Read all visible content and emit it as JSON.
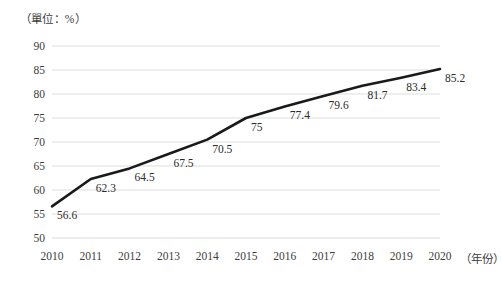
{
  "chart_data": {
    "type": "line",
    "title": "（單位：%）",
    "xlabel": "（年份）",
    "ylabel": "",
    "categories": [
      "2010",
      "2011",
      "2012",
      "2013",
      "2014",
      "2015",
      "2016",
      "2017",
      "2018",
      "2019",
      "2020"
    ],
    "values": [
      56.6,
      62.3,
      64.5,
      67.5,
      70.5,
      75,
      77.4,
      79.6,
      81.7,
      83.4,
      85.2
    ],
    "point_labels": [
      "56.6",
      "62.3",
      "64.5",
      "67.5",
      "70.5",
      "75",
      "77.4",
      "79.6",
      "81.7",
      "83.4",
      "85.2"
    ],
    "ylim": [
      50,
      90
    ],
    "yticks": [
      50,
      55,
      60,
      65,
      70,
      75,
      80,
      85,
      90
    ],
    "ytick_labels": [
      "50",
      "55",
      "60",
      "65",
      "70",
      "75",
      "80",
      "85",
      "90"
    ],
    "grid": "horizontal",
    "legend": "none",
    "series_color": "#1a1a1a",
    "grid_color": "#d9d9d9",
    "line_width": 2.6
  }
}
